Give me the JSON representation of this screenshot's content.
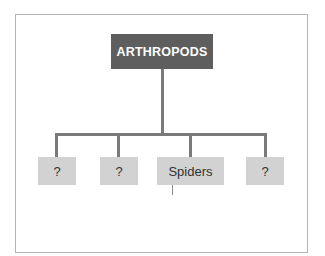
{
  "diagram": {
    "root": {
      "label": "ARTHROPODS",
      "color": "#5e5e5e"
    },
    "children": [
      {
        "label": "?"
      },
      {
        "label": "?"
      },
      {
        "label": "Spiders"
      },
      {
        "label": "?"
      }
    ],
    "box_color": "#d2d2d2",
    "connector_color": "#7a7a7a"
  }
}
